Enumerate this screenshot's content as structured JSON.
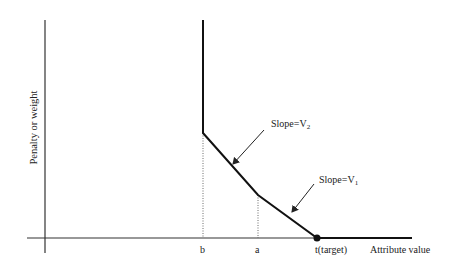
{
  "diagram": {
    "type": "piecewise-linear penalty function",
    "y_axis_label": "Penalty or weight",
    "x_axis_label": "Attribute value",
    "x_ticks": [
      {
        "label": "b"
      },
      {
        "label": "a"
      },
      {
        "label": "t(target)"
      }
    ],
    "annotations": [
      {
        "text": "Slope=V",
        "sub": "2"
      },
      {
        "text": "Slope=V",
        "sub": "1"
      }
    ],
    "colors": {
      "line": "#111111",
      "axis": "#333333",
      "background": "#ffffff"
    }
  }
}
